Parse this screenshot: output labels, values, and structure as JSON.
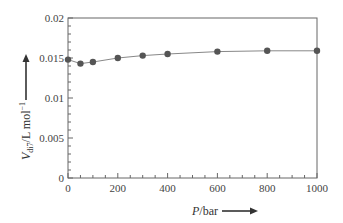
{
  "chart_data": {
    "type": "line",
    "title": "",
    "xlabel": "P/bar",
    "ylabel_main": "V",
    "ylabel_sub": "di7",
    "ylabel_rest": "/L mol",
    "ylabel_sup": "−1",
    "xlim": [
      0,
      1000
    ],
    "ylim": [
      0,
      0.02
    ],
    "x_ticks": [
      "0",
      "200",
      "400",
      "600",
      "800",
      "1000"
    ],
    "y_ticks": [
      "0",
      "0.005",
      "0.01",
      "0.015",
      "0.02"
    ],
    "grid": false,
    "legend": null,
    "series": [
      {
        "name": "V_di7",
        "x": [
          0,
          50,
          100,
          200,
          300,
          400,
          600,
          800,
          1000
        ],
        "y": [
          0.0148,
          0.0143,
          0.0145,
          0.015,
          0.0153,
          0.0155,
          0.0158,
          0.0159,
          0.0159
        ]
      }
    ]
  },
  "colors": {
    "axis": "#666666",
    "line": "#888888",
    "marker": "#555555"
  }
}
